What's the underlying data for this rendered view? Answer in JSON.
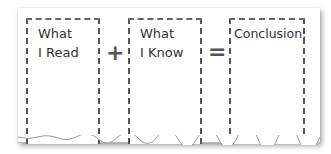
{
  "diagram": {
    "boxes": [
      {
        "label": "What\nI Read"
      },
      {
        "label": "What\nI Know"
      },
      {
        "label": "Conclusion:"
      }
    ],
    "operators": {
      "plus": "+",
      "equals": "="
    },
    "colors": {
      "ink": "#555555",
      "paper": "#ffffff",
      "text": "#333333"
    }
  }
}
